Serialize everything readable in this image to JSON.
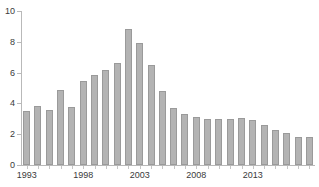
{
  "chart_data": {
    "type": "bar",
    "title": "",
    "subtitle": "",
    "xlabel": "",
    "ylabel": "",
    "grid": false,
    "legend": "none",
    "ylim": [
      0,
      10
    ],
    "ytick_values": [
      0,
      2,
      4,
      6,
      8,
      10
    ],
    "ytick_labels": [
      "0",
      "2",
      "4",
      "6",
      "8",
      "10"
    ],
    "xtick_labels": [
      "1993",
      "1998",
      "2003",
      "2008",
      "2013"
    ],
    "xtick_categories": [
      "1993",
      "1998",
      "2003",
      "2008",
      "2013"
    ],
    "bar_color": "#b3b3b3",
    "bar_border_color": "#9a9a9a",
    "axis_color": "#b9b9b9",
    "text_color": "#3a3a3a",
    "categories": [
      "1993",
      "1994",
      "1995",
      "1996",
      "1997",
      "1998",
      "1999",
      "2000",
      "2001",
      "2002",
      "2003",
      "2004",
      "2005",
      "2006",
      "2007",
      "2008",
      "2009",
      "2010",
      "2011",
      "2012",
      "2013",
      "2014",
      "2015",
      "2016",
      "2017",
      "2018"
    ],
    "values": [
      3.5,
      3.8,
      3.55,
      4.9,
      3.75,
      5.45,
      5.85,
      6.15,
      6.6,
      8.85,
      7.95,
      6.5,
      4.8,
      3.7,
      3.3,
      3.1,
      3.0,
      3.0,
      3.0,
      3.05,
      2.95,
      2.6,
      2.3,
      2.05,
      1.85,
      1.85
    ]
  }
}
